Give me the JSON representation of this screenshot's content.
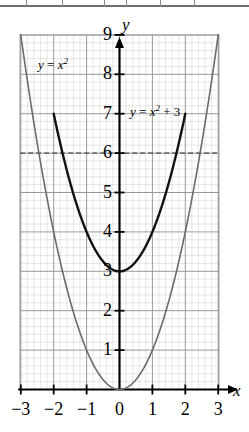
{
  "chart_data": {
    "type": "line",
    "title": "",
    "xlabel": "x",
    "ylabel": "y",
    "xlim": [
      -3.1,
      3.1
    ],
    "ylim": [
      0,
      9.1
    ],
    "grid": true,
    "grid_minor": true,
    "legend_position": "in-plot-annotations",
    "x_ticks": [
      "−3",
      "−2",
      "−1",
      "0",
      "1",
      "2",
      "3"
    ],
    "x_tick_values": [
      -3,
      -2,
      -1,
      0,
      1,
      2,
      3
    ],
    "y_ticks": [
      "1",
      "2",
      "3",
      "4",
      "5",
      "6",
      "7",
      "8",
      "9"
    ],
    "y_tick_values": [
      1,
      2,
      3,
      4,
      5,
      6,
      7,
      8,
      9
    ],
    "annotations": [
      {
        "text_parts": {
          "lhs": "y",
          "eq": " = ",
          "base": "x",
          "exp": "2",
          "tail": ""
        },
        "label": "y = x²",
        "x": -2.0,
        "y": 8.4
      },
      {
        "text_parts": {
          "lhs": "y",
          "eq": " = ",
          "base": "x",
          "exp": "2",
          "tail": " + 3"
        },
        "label": "y = x² + 3",
        "x": 0.3,
        "y": 7.2
      }
    ],
    "reference_lines": [
      {
        "orientation": "horizontal",
        "value": 6,
        "style": "dashed",
        "color": "#4a4a4a"
      }
    ],
    "series": [
      {
        "name": "y = x²",
        "equation": "y = x^2",
        "color": "#6b6b6b",
        "linewidth": 1.6,
        "x": [
          -3,
          -2.75,
          -2.5,
          -2.25,
          -2,
          -1.75,
          -1.5,
          -1.25,
          -1,
          -0.75,
          -0.5,
          -0.25,
          0,
          0.25,
          0.5,
          0.75,
          1,
          1.25,
          1.5,
          1.75,
          2,
          2.25,
          2.5,
          2.75,
          3
        ],
        "values": [
          9,
          7.5625,
          6.25,
          5.0625,
          4,
          3.0625,
          2.25,
          1.5625,
          1,
          0.5625,
          0.25,
          0.0625,
          0,
          0.0625,
          0.25,
          0.5625,
          1,
          1.5625,
          2.25,
          3.0625,
          4,
          5.0625,
          6.25,
          7.5625,
          9
        ],
        "vertex": [
          0,
          0
        ]
      },
      {
        "name": "y = x² + 3",
        "equation": "y = x^2 + 3",
        "color": "#111111",
        "linewidth": 2.4,
        "x": [
          -2,
          -1.75,
          -1.5,
          -1.25,
          -1,
          -0.75,
          -0.5,
          -0.25,
          0,
          0.25,
          0.5,
          0.75,
          1,
          1.25,
          1.5,
          1.75,
          2
        ],
        "values": [
          7,
          6.0625,
          5.25,
          4.5625,
          4,
          3.5625,
          3.25,
          3.0625,
          3,
          3.0625,
          3.25,
          3.5625,
          4,
          4.5625,
          5.25,
          6.0625,
          7
        ],
        "vertex": [
          0,
          3
        ]
      }
    ],
    "axes": {
      "y_axis_label": "y",
      "x_axis_label": "x",
      "y_arrow": true,
      "x_arrow": true
    }
  }
}
